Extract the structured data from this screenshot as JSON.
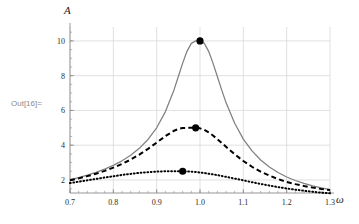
{
  "notebook": {
    "out_prompt": "Out[16]="
  },
  "chart_data": {
    "type": "line",
    "title": "",
    "subtitle": "",
    "xlabel": "ω",
    "ylabel": "A",
    "xlim": [
      0.7,
      1.3
    ],
    "ylim": [
      1.25,
      10.8
    ],
    "grid": true,
    "legend_position": "none",
    "x_ticks": [
      "0.7",
      "0.8",
      "0.9",
      "1.0",
      "1.1",
      "1.2",
      "1.3"
    ],
    "x_tick_values": [
      0.7,
      0.8,
      0.9,
      1.0,
      1.1,
      1.2,
      1.3
    ],
    "y_ticks": [
      "2",
      "4",
      "6",
      "8",
      "10"
    ],
    "y_tick_values": [
      2,
      4,
      6,
      8,
      10
    ],
    "x_minor_step": 0.02,
    "y_minor_step": 0.5,
    "colors": {
      "curve_solid": "#808080",
      "curve_dashed": "#000000",
      "curve_dotted": "#000000",
      "marker": "#000000",
      "grid": "#d4d4d4",
      "frame": "#8c8c8c",
      "prompt": "#8a8a8a"
    },
    "series": [
      {
        "name": "low damping",
        "style": "solid",
        "color": "#808080",
        "peak": {
          "x": 1.0,
          "y": 10.0
        },
        "x": [
          0.7,
          0.72,
          0.74,
          0.76,
          0.78,
          0.8,
          0.82,
          0.84,
          0.86,
          0.88,
          0.9,
          0.92,
          0.94,
          0.95,
          0.96,
          0.97,
          0.98,
          0.99,
          1.0,
          1.01,
          1.02,
          1.03,
          1.04,
          1.05,
          1.06,
          1.08,
          1.1,
          1.12,
          1.14,
          1.16,
          1.18,
          1.2,
          1.22,
          1.24,
          1.26,
          1.28,
          1.3
        ],
        "values": [
          2.02,
          2.14,
          2.28,
          2.44,
          2.62,
          2.84,
          3.1,
          3.42,
          3.82,
          4.33,
          5.0,
          5.92,
          7.18,
          7.95,
          8.72,
          9.4,
          9.86,
          10.0,
          10.0,
          9.86,
          9.4,
          8.72,
          7.95,
          7.18,
          6.45,
          5.26,
          4.35,
          3.67,
          3.15,
          2.75,
          2.43,
          2.17,
          1.97,
          1.8,
          1.66,
          1.54,
          1.45
        ]
      },
      {
        "name": "medium damping",
        "style": "dashed",
        "color": "#000000",
        "peak": {
          "x": 0.99,
          "y": 5.0
        },
        "x": [
          0.7,
          0.72,
          0.74,
          0.76,
          0.78,
          0.8,
          0.82,
          0.84,
          0.86,
          0.88,
          0.9,
          0.92,
          0.94,
          0.95,
          0.96,
          0.97,
          0.98,
          0.99,
          1.0,
          1.01,
          1.02,
          1.03,
          1.04,
          1.05,
          1.06,
          1.08,
          1.1,
          1.12,
          1.14,
          1.16,
          1.18,
          1.2,
          1.22,
          1.24,
          1.26,
          1.28,
          1.3
        ],
        "values": [
          1.98,
          2.09,
          2.22,
          2.36,
          2.52,
          2.71,
          2.92,
          3.17,
          3.46,
          3.79,
          4.15,
          4.52,
          4.83,
          4.93,
          4.99,
          5.0,
          5.0,
          5.0,
          4.97,
          4.88,
          4.74,
          4.56,
          4.35,
          4.13,
          3.91,
          3.48,
          3.09,
          2.76,
          2.48,
          2.25,
          2.05,
          1.89,
          1.76,
          1.65,
          1.56,
          1.48,
          1.42
        ]
      },
      {
        "name": "high damping",
        "style": "dotted",
        "color": "#000000",
        "peak": {
          "x": 0.96,
          "y": 2.5
        },
        "x": [
          0.7,
          0.72,
          0.74,
          0.76,
          0.78,
          0.8,
          0.82,
          0.84,
          0.86,
          0.88,
          0.9,
          0.92,
          0.94,
          0.95,
          0.96,
          0.97,
          0.98,
          0.99,
          1.0,
          1.01,
          1.02,
          1.03,
          1.04,
          1.05,
          1.06,
          1.08,
          1.1,
          1.12,
          1.14,
          1.16,
          1.18,
          1.2,
          1.22,
          1.24,
          1.26,
          1.28,
          1.3
        ],
        "values": [
          1.82,
          1.9,
          1.98,
          2.06,
          2.14,
          2.21,
          2.29,
          2.35,
          2.41,
          2.45,
          2.48,
          2.5,
          2.5,
          2.5,
          2.5,
          2.49,
          2.48,
          2.46,
          2.43,
          2.4,
          2.36,
          2.32,
          2.28,
          2.23,
          2.18,
          2.08,
          1.98,
          1.87,
          1.77,
          1.68,
          1.59,
          1.51,
          1.44,
          1.38,
          1.32,
          1.27,
          1.23
        ]
      }
    ],
    "markers": [
      {
        "x": 1.0,
        "y": 10.0,
        "label": "peak-marker-1"
      },
      {
        "x": 0.99,
        "y": 5.0,
        "label": "peak-marker-2"
      },
      {
        "x": 0.96,
        "y": 2.5,
        "label": "peak-marker-3"
      }
    ]
  }
}
